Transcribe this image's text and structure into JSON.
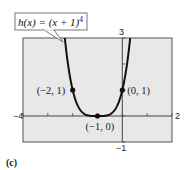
{
  "chart_data": {
    "type": "line",
    "title": "",
    "function_label": "h(x) = (x + 1)^4",
    "function_label_parts": {
      "main": "h(x) = (x + 1)",
      "exponent": "4"
    },
    "xlabel": "",
    "ylabel": "",
    "xlim": [
      -4,
      2
    ],
    "ylim": [
      -1,
      3
    ],
    "x_ticks": [
      -4,
      -3,
      -2,
      -1,
      0,
      1,
      2
    ],
    "y_ticks": [
      -1,
      0,
      1,
      2,
      3
    ],
    "tick_labels": {
      "x_min": "−4",
      "x_max": "2",
      "y_max": "3",
      "y_min": "−1"
    },
    "grid": false,
    "series": [
      {
        "name": "h(x) = (x + 1)^4",
        "expression": "(x+1)^4",
        "color": "#111111"
      }
    ],
    "points": [
      {
        "x": -2,
        "y": 1,
        "label": "(−2, 1)"
      },
      {
        "x": -1,
        "y": 0,
        "label": "(−1, 0)"
      },
      {
        "x": 0,
        "y": 1,
        "label": "(0, 1)"
      }
    ],
    "colors": {
      "plot_bg": "#e8e8e8",
      "frame": "#555555",
      "axis": "#444444",
      "curve": "#111111"
    }
  },
  "caption": "(c)"
}
